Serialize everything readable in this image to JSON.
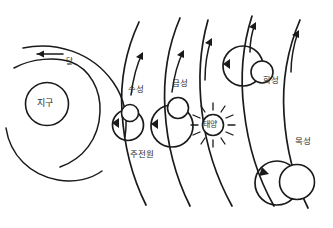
{
  "diagram": {
    "style": "hand-drawn ink sketch",
    "ink_color": "#1a1a1a",
    "background_color": "#ffffff",
    "labels": {
      "earth": "지구",
      "moon": "달",
      "mercury": "수성",
      "venus": "금성",
      "sun": "태양",
      "mars": "화성",
      "jupiter": "목성",
      "epicycle": "주전원"
    },
    "bodies": [
      {
        "name": "earth",
        "label": "지구",
        "cx": 47,
        "cy": 104,
        "r": 21.5,
        "kind": "central-body"
      },
      {
        "name": "moon",
        "label": "달",
        "cx": 71,
        "cy": 62,
        "r": 9.5,
        "kind": "satellite"
      },
      {
        "name": "mercury",
        "label": "수성",
        "cx": 130,
        "cy": 113,
        "r": 8.5,
        "kind": "planet"
      },
      {
        "name": "venus",
        "label": "금성",
        "cx": 178,
        "cy": 108,
        "r": 10.5,
        "kind": "planet"
      },
      {
        "name": "sun",
        "label": "태양",
        "cx": 213,
        "cy": 125,
        "r": 10.5,
        "kind": "star"
      },
      {
        "name": "mars",
        "label": "화성",
        "cx": 262,
        "cy": 72,
        "r": 11.0,
        "kind": "planet"
      },
      {
        "name": "jupiter",
        "label": "목성",
        "cx": 297,
        "cy": 182,
        "r": 17.5,
        "kind": "planet"
      }
    ],
    "epicycles": [
      {
        "name": "mercury-epicycle",
        "cx": 128,
        "cy": 125,
        "r": 15.5
      },
      {
        "name": "venus-epicycle",
        "cx": 172,
        "cy": 126,
        "r": 21.0
      },
      {
        "name": "mars-epicycle",
        "cx": 243,
        "cy": 66,
        "r": 20.0
      },
      {
        "name": "jupiter-epicycle",
        "cx": 277,
        "cy": 183,
        "r": 22.0
      }
    ],
    "sun_rays": 12,
    "arrow_direction_note": "counterclockwise epicycle arrows, upward deferent arrows, leftward lunar arrow"
  }
}
